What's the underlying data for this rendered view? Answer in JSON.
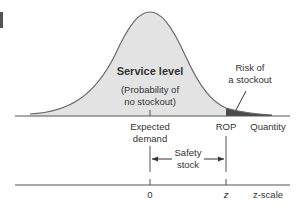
{
  "diagram": {
    "title": "Service level",
    "subtitle_line1": "(Probability of",
    "subtitle_line2": "no stockout)",
    "risk_label_line1": "Risk of",
    "risk_label_line2": "a stockout",
    "x_axis_label": "Quantity",
    "mean_label_line1": "Expected",
    "mean_label_line2": "demand",
    "rop_label": "ROP",
    "safety_label_line1": "Safety",
    "safety_label_line2": "stock",
    "zscale_label": "z-scale",
    "zscale_zero": "0",
    "zscale_z": "z"
  },
  "colors": {
    "curve_fill": "#e3e3e3",
    "tail_fill": "#4a4a4a",
    "line": "#555555",
    "text": "#333333"
  }
}
